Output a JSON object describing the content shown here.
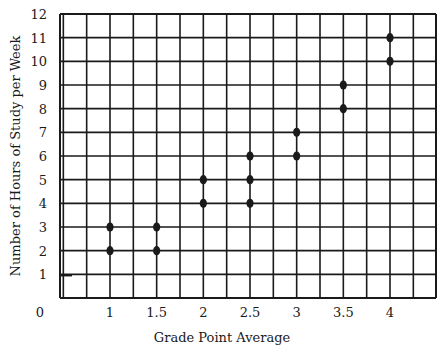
{
  "chart_data": {
    "type": "scatter",
    "title": "",
    "xlabel": "Grade Point Average",
    "ylabel": "Number of Hours of Study per Week",
    "x_tick_labels": [
      "0",
      "1",
      "1.5",
      "2",
      "2.5",
      "3",
      "3.5",
      "4"
    ],
    "y_tick_labels": [
      "1",
      "2",
      "3",
      "4",
      "5",
      "6",
      "7",
      "8",
      "9",
      "10",
      "11",
      "12"
    ],
    "xlim": [
      0.5,
      4.5
    ],
    "ylim": [
      0,
      12
    ],
    "grid": true,
    "legend": null,
    "series": [
      {
        "name": "Students",
        "points": [
          {
            "x": 1,
            "y": 2
          },
          {
            "x": 1,
            "y": 3
          },
          {
            "x": 1.5,
            "y": 2
          },
          {
            "x": 1.5,
            "y": 3
          },
          {
            "x": 2,
            "y": 4
          },
          {
            "x": 2,
            "y": 5
          },
          {
            "x": 2.5,
            "y": 4
          },
          {
            "x": 2.5,
            "y": 5
          },
          {
            "x": 2.5,
            "y": 6
          },
          {
            "x": 3,
            "y": 6
          },
          {
            "x": 3,
            "y": 7
          },
          {
            "x": 3.5,
            "y": 8
          },
          {
            "x": 3.5,
            "y": 9
          },
          {
            "x": 4,
            "y": 10
          },
          {
            "x": 4,
            "y": 11
          }
        ]
      }
    ]
  },
  "colors": {
    "ink": "#1a1a1a",
    "background": "#ffffff"
  }
}
